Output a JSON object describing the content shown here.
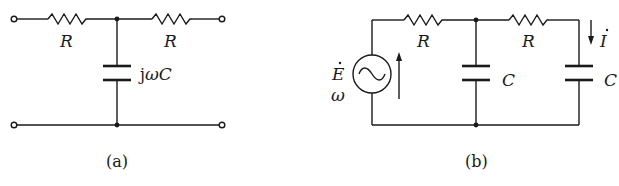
{
  "figure_a": {
    "caption": "(a)",
    "resistor_left_label": "R",
    "resistor_right_label": "R",
    "capacitor_label_prefix": "j",
    "capacitor_label_omega": "ω",
    "capacitor_label_c": "C"
  },
  "figure_b": {
    "caption": "(b)",
    "source_label": "E",
    "source_freq_label": "ω",
    "source_symbol": "~",
    "resistor_left_label": "R",
    "resistor_right_label": "R",
    "capacitor_mid_label": "C",
    "capacitor_right_label": "C",
    "current_label": "I"
  },
  "colors": {
    "stroke": "#1a1a1a",
    "background": "#ffffff"
  }
}
